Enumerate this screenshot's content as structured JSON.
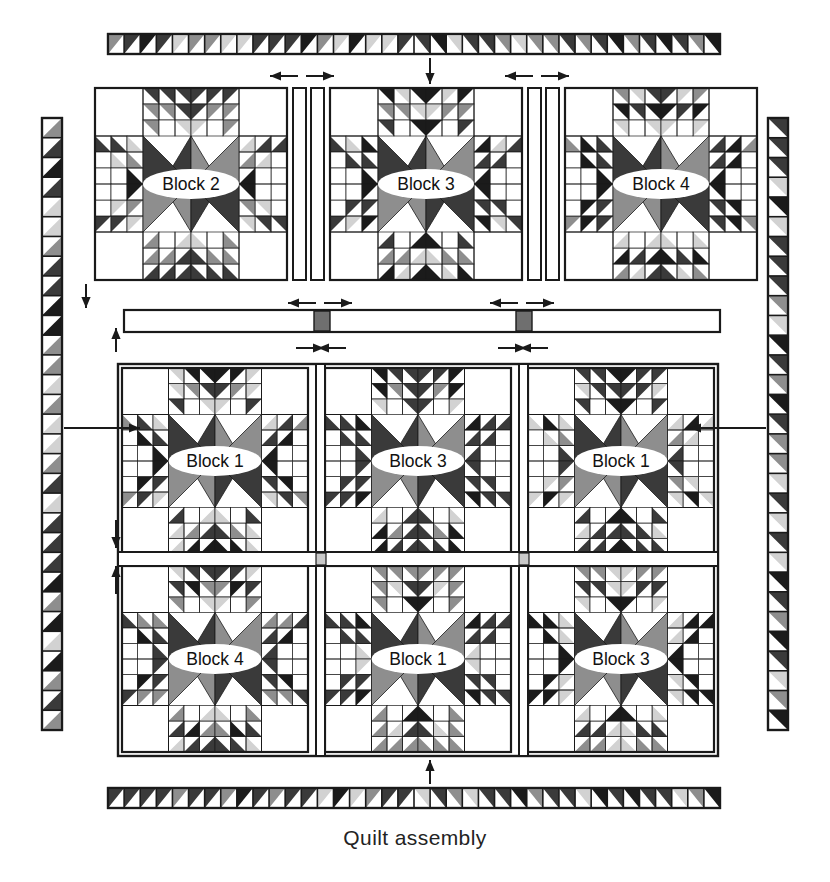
{
  "figure": {
    "caption": "Quilt assembly",
    "type": "quilt-assembly-diagram"
  },
  "palette": {
    "dark": "#3a3a3a",
    "black": "#1b1b1b",
    "medium": "#8e8e8e",
    "light": "#d2d2d2",
    "pale": "#ececec",
    "white": "#ffffff",
    "outline": "#1a1a1a",
    "cornerstone_dark": "#6f6f6f",
    "cornerstone_light": "#c9c9c9"
  },
  "borders": {
    "top": {
      "name": "top-sawtooth-border",
      "units": 38,
      "orientation": "horizontal",
      "mirrored_at_center": true
    },
    "bottom": {
      "name": "bottom-sawtooth-border",
      "units": 38,
      "orientation": "horizontal",
      "mirrored_at_center": true
    },
    "left": {
      "name": "left-sawtooth-border",
      "units": 31,
      "orientation": "vertical",
      "mirrored_at_center": false
    },
    "right": {
      "name": "right-sawtooth-border",
      "units": 31,
      "orientation": "vertical",
      "mirrored_at_center": false
    }
  },
  "top_row": {
    "label": "top-block-row",
    "blocks": [
      {
        "label": "Block 2",
        "corner_accent": "none"
      },
      {
        "label": "Block 3",
        "corner_accent": "none"
      },
      {
        "label": "Block 4",
        "corner_accent": "none"
      }
    ],
    "sashing_strips": 2,
    "sashing_fill": "#ffffff"
  },
  "middle_sashing": {
    "label": "horizontal-sashing-row",
    "fill": "#ffffff",
    "cornerstones": 2,
    "cornerstone_fill": "#6f6f6f"
  },
  "bottom_rows": [
    {
      "label": "bottom-block-row-1",
      "blocks": [
        {
          "label": "Block 1",
          "corner_accent": "top-right"
        },
        {
          "label": "Block 3",
          "corner_accent": "none"
        },
        {
          "label": "Block 1",
          "corner_accent": "top-left"
        }
      ]
    },
    {
      "label": "bottom-block-row-2",
      "blocks": [
        {
          "label": "Block 4",
          "corner_accent": "none"
        },
        {
          "label": "Block 1",
          "corner_accent": "bottom-left"
        },
        {
          "label": "Block 3",
          "corner_accent": "none"
        }
      ]
    }
  ],
  "inner_sashing": {
    "label": "inner-horizontal-sashing",
    "fill": "#ffffff",
    "cornerstones": 2,
    "cornerstone_fill": "#c9c9c9"
  },
  "arrows": [
    {
      "name": "arrow-top-border-down",
      "direction": "down"
    },
    {
      "name": "arrow-top-sash-left",
      "direction": "left"
    },
    {
      "name": "arrow-top-sash-right",
      "direction": "right"
    },
    {
      "name": "arrow-top-sash2-left",
      "direction": "left"
    },
    {
      "name": "arrow-top-sash2-right",
      "direction": "right"
    },
    {
      "name": "arrow-midsash-left-a",
      "direction": "left"
    },
    {
      "name": "arrow-midsash-right-a",
      "direction": "right"
    },
    {
      "name": "arrow-midsash-left-b",
      "direction": "left"
    },
    {
      "name": "arrow-midsash-right-b",
      "direction": "right"
    },
    {
      "name": "arrow-lowsash-right-a",
      "direction": "right"
    },
    {
      "name": "arrow-lowsash-left-a",
      "direction": "left"
    },
    {
      "name": "arrow-lowsash-right-b",
      "direction": "right"
    },
    {
      "name": "arrow-lowsash-left-b",
      "direction": "left"
    },
    {
      "name": "arrow-left-down-upper",
      "direction": "down"
    },
    {
      "name": "arrow-left-up-lower",
      "direction": "up"
    },
    {
      "name": "arrow-left-border-right",
      "direction": "right"
    },
    {
      "name": "arrow-right-border-left",
      "direction": "left"
    },
    {
      "name": "arrow-left-down-mid",
      "direction": "down"
    },
    {
      "name": "arrow-left-up-mid",
      "direction": "up"
    },
    {
      "name": "arrow-bottom-border-up",
      "direction": "up"
    }
  ]
}
